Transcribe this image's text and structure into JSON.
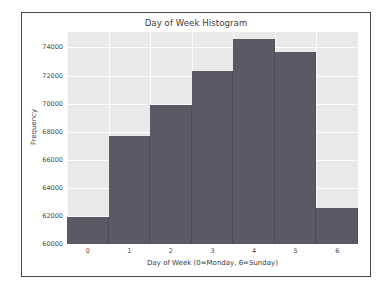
{
  "figure": {
    "background_color": "#ffffff",
    "border_color": "#4a4a4a",
    "plot_background_color": "#e9e9e9",
    "grid_color": "#fbfbfb",
    "bar_color": "#595a66"
  },
  "chart_data": {
    "type": "bar",
    "title": "Day of Week Histogram",
    "xlabel": "Day of Week (0=Monday, 6=Sunday)",
    "ylabel": "Frequency",
    "categories": [
      "0",
      "1",
      "2",
      "3",
      "4",
      "5",
      "6"
    ],
    "values": [
      61900,
      67700,
      69900,
      72300,
      74600,
      73700,
      62550
    ],
    "xtick_labels": [
      "0",
      "1",
      "2",
      "3",
      "4",
      "5",
      "6"
    ],
    "ytick_labels": [
      "60000",
      "62000",
      "64000",
      "66000",
      "68000",
      "70000",
      "72000",
      "74000"
    ],
    "ytick_values": [
      60000,
      62000,
      64000,
      66000,
      68000,
      70000,
      72000,
      74000
    ],
    "ylim": [
      60000,
      75100
    ],
    "xlim": [
      -0.5,
      6.5
    ],
    "grid": true,
    "legend": null
  }
}
